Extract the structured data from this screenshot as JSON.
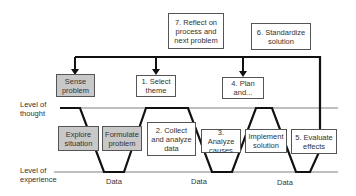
{
  "diagram": {
    "levels": {
      "thought": "Level of\nthought",
      "experience": "Level of\nexperience"
    },
    "top_boxes": {
      "reflect": "7. Reflect on process and next problem",
      "standardize": "6. Standardize solution"
    },
    "thought_boxes": {
      "sense": "Sense problem",
      "select": "1. Select theme",
      "plan": "4. Plan and..."
    },
    "middle_boxes": {
      "explore": "Explore situation",
      "formulate": "Formulate problem",
      "collect": "2. Collect and analyze data",
      "analyze": "3. Analyze causes",
      "implement": "Implement solution",
      "evaluate": "5. Evaluate effects"
    },
    "data_labels": [
      "Data",
      "Data",
      "Data"
    ],
    "colors": {
      "path": "#111111",
      "level_line": "#aaaaaa",
      "gray_box": "#c8c8c8"
    }
  }
}
